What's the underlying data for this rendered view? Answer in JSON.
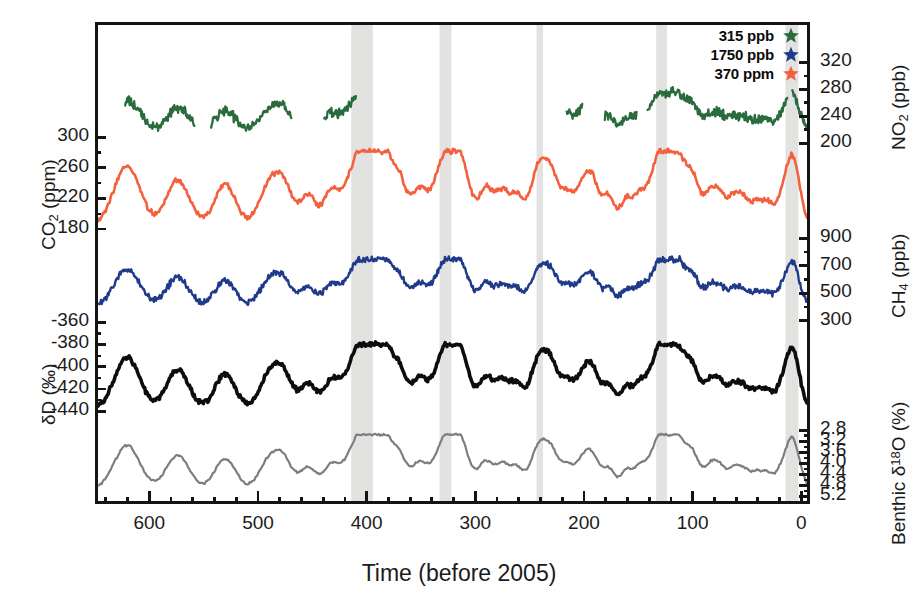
{
  "chart_data": {
    "type": "line",
    "title": "",
    "xlabel": "Time (before 2005)",
    "xunit": "kyr",
    "xlim": [
      650,
      -8
    ],
    "xticks": [
      600,
      500,
      400,
      300,
      200,
      100,
      0
    ],
    "xtick_labels": [
      "600",
      "500",
      "400",
      "300",
      "200",
      "100",
      "0"
    ],
    "xminor_step": 20,
    "grid": false,
    "legend_position": "top-right",
    "axes": [
      {
        "id": "n2o",
        "side": "right",
        "label": "NO",
        "label_sub": "2",
        "label_unit": " (ppb)",
        "ticks": [
          320,
          280,
          240,
          200
        ],
        "tick_labels": [
          "320",
          "280",
          "240",
          "200"
        ],
        "range": [
          190,
          340
        ],
        "color": "#2a6b3d"
      },
      {
        "id": "co2",
        "side": "left",
        "label": "CO",
        "label_sub": "2",
        "label_unit": " (ppm)",
        "ticks": [
          300,
          260,
          220,
          180
        ],
        "tick_labels": [
          "300",
          "260",
          "220",
          "180"
        ],
        "range": [
          170,
          315
        ],
        "color": "#f4603e"
      },
      {
        "id": "ch4",
        "side": "right",
        "label": "CH",
        "label_sub": "4",
        "label_unit": " (ppb)",
        "ticks": [
          900,
          700,
          500,
          300
        ],
        "tick_labels": [
          "900",
          "700",
          "500",
          "300"
        ],
        "range": [
          280,
          1000
        ],
        "color": "#1f3a8a"
      },
      {
        "id": "dd",
        "side": "left",
        "label": "δD (‰)",
        "label_sub": "",
        "label_unit": "",
        "ticks": [
          -360,
          -380,
          -400,
          -420,
          -440
        ],
        "tick_labels": [
          "-360",
          "-380",
          "-400",
          "-420",
          "-440"
        ],
        "range": [
          -450,
          -350
        ],
        "color": "#0d0d0d"
      },
      {
        "id": "d18o",
        "side": "right",
        "label": "Benthic δ",
        "label_sup": "18",
        "label_unit": "O (%)",
        "ticks": [
          2.8,
          3.2,
          3.6,
          4.0,
          4.4,
          4.8,
          5.2
        ],
        "tick_labels": [
          "2.8",
          "3.2",
          "3.6",
          "4.0",
          "4.4",
          "4.8",
          "5.2"
        ],
        "range": [
          5.4,
          2.6
        ],
        "inverted": true,
        "color": "#7d7d7d"
      }
    ],
    "series": [
      {
        "name": "N2O",
        "axis": "n2o",
        "color": "#2a6b3d",
        "unit": "ppb"
      },
      {
        "name": "CO2",
        "axis": "co2",
        "color": "#f4603e",
        "unit": "ppm"
      },
      {
        "name": "CH4",
        "axis": "ch4",
        "color": "#1f3a8a",
        "unit": "ppb"
      },
      {
        "name": "dD",
        "axis": "dd",
        "color": "#0d0d0d",
        "unit": "permil"
      },
      {
        "name": "Benthic d18O",
        "axis": "d18o",
        "color": "#7d7d7d",
        "unit": "permil"
      }
    ],
    "interglacial_bands_kyr": [
      [
        415,
        395
      ],
      [
        333,
        322
      ],
      [
        243,
        237
      ],
      [
        132,
        122
      ],
      [
        12,
        0
      ]
    ]
  },
  "legend": {
    "items": [
      {
        "value": "315 ppb",
        "color": "#2a6b3d",
        "marker": "star",
        "series": "N2O"
      },
      {
        "value": "1750 ppb",
        "color": "#1f3a8a",
        "marker": "star",
        "series": "CH4"
      },
      {
        "value": "370 ppm",
        "color": "#f4603e",
        "marker": "star",
        "series": "CO2"
      }
    ]
  },
  "xaxis": {
    "title": "Time (before 2005)",
    "tick_labels": [
      "600",
      "500",
      "400",
      "300",
      "200",
      "100",
      "0"
    ]
  },
  "yaxes": {
    "n2o": {
      "title_main": "NO",
      "title_sub": "2",
      "title_unit": " (ppb)",
      "tick_labels": [
        "320",
        "280",
        "240",
        "200"
      ]
    },
    "co2": {
      "title_main": "CO",
      "title_sub": "2",
      "title_unit": " (ppm)",
      "tick_labels": [
        "300",
        "260",
        "220",
        "180"
      ]
    },
    "ch4": {
      "title_main": "CH",
      "title_sub": "4",
      "title_unit": " (ppb)",
      "tick_labels": [
        "900",
        "700",
        "500",
        "300"
      ]
    },
    "dd": {
      "title_main": "δD (‰)",
      "tick_labels": [
        "-360",
        "-380",
        "-400",
        "-420",
        "-440"
      ]
    },
    "d18o": {
      "title_main": "Benthic δ",
      "title_sup": "18",
      "title_unit": "O (%)",
      "tick_labels": [
        "2.8",
        "3.2",
        "3.6",
        "4.0",
        "4.4",
        "4.8",
        "5.2"
      ]
    }
  }
}
